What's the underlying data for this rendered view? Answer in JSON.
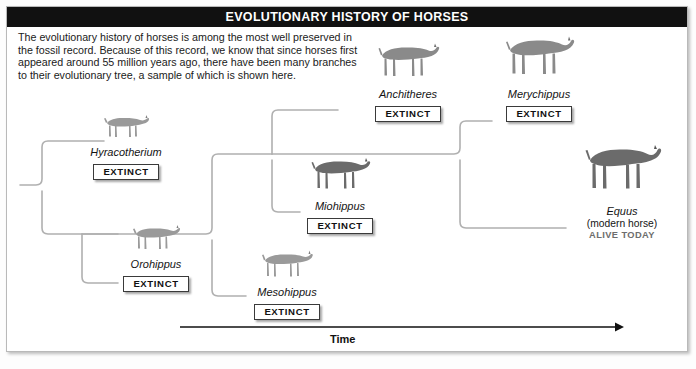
{
  "title": "EVOLUTIONARY HISTORY OF HORSES",
  "intro": "The evolutionary history of horses is among the most well preserved in the fossil record. Because of this record, we know that since horses first appeared around 55 million years ago, there have been many branches to their evolutionary tree, a sample of which is shown here.",
  "axis": {
    "label": "Time",
    "direction": "left-to-right"
  },
  "badge_extinct": "EXTINCT",
  "colors": {
    "title_bar": "#111111",
    "title_text": "#ffffff",
    "frame_border": "#b9b9b9",
    "branch_line": "#b0b0b0",
    "axis_line": "#111111",
    "silhouette_light": "#9a9a9a",
    "silhouette_mid": "#8a8a8a",
    "silhouette_dark": "#6b6b6b",
    "alive_text": "#6d6d6d"
  },
  "taxa": [
    {
      "id": "hyracotherium",
      "name": "Hyracotherium",
      "status": "EXTINCT",
      "extinct": true,
      "tone": "light",
      "size": "small"
    },
    {
      "id": "orohippus",
      "name": "Orohippus",
      "status": "EXTINCT",
      "extinct": true,
      "tone": "light",
      "size": "small"
    },
    {
      "id": "mesohippus",
      "name": "Mesohippus",
      "status": "EXTINCT",
      "extinct": true,
      "tone": "light",
      "size": "small"
    },
    {
      "id": "miohippus",
      "name": "Miohippus",
      "status": "EXTINCT",
      "extinct": true,
      "tone": "dark",
      "size": "medium"
    },
    {
      "id": "anchitheres",
      "name": "Anchitheres",
      "status": "EXTINCT",
      "extinct": true,
      "tone": "mid",
      "size": "medium"
    },
    {
      "id": "merychippus",
      "name": "Merychippus",
      "status": "EXTINCT",
      "extinct": true,
      "tone": "mid",
      "size": "large"
    },
    {
      "id": "equus",
      "name": "Equus",
      "subtitle": "(modern horse)",
      "status": "ALIVE TODAY",
      "extinct": false,
      "tone": "dark",
      "size": "large"
    }
  ],
  "tree": {
    "root_label": "common ancestor",
    "edges": [
      {
        "from": "root",
        "to": "hyracotherium"
      },
      {
        "from": "root",
        "to": "node-orohippus"
      },
      {
        "from": "node-orohippus",
        "to": "orohippus"
      },
      {
        "from": "node-orohippus",
        "to": "node-mesohippus"
      },
      {
        "from": "node-mesohippus",
        "to": "mesohippus"
      },
      {
        "from": "node-mesohippus",
        "to": "node-miohippus"
      },
      {
        "from": "node-miohippus",
        "to": "anchitheres"
      },
      {
        "from": "node-miohippus",
        "to": "miohippus"
      },
      {
        "from": "miohippus",
        "to": "node-merychippus"
      },
      {
        "from": "node-merychippus",
        "to": "merychippus"
      },
      {
        "from": "node-merychippus",
        "to": "equus"
      }
    ]
  }
}
